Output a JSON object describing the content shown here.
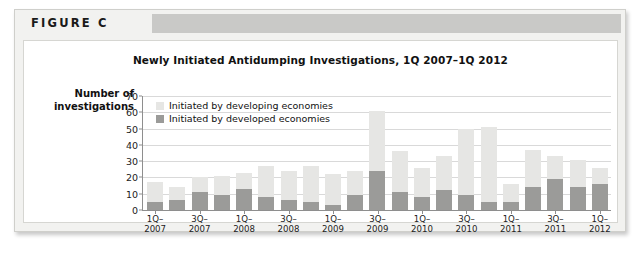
{
  "figure": {
    "label": "FIGURE C"
  },
  "chart_data": {
    "type": "bar",
    "subtype": "stacked-vertical",
    "title": "Newly Initiated Antidumping Investigations, 1Q 2007–1Q 2012",
    "xlabel": "",
    "ylabel": "Number of investigations",
    "ylabel_line1": "Number of",
    "ylabel_line2": "investigations",
    "ylim": [
      0,
      70
    ],
    "ytick_step": 10,
    "yticks": [
      0,
      10,
      20,
      30,
      40,
      50,
      60,
      70
    ],
    "grid": true,
    "grid_axis": "y",
    "legend_position": "top-left-inside",
    "categories": [
      "1Q-2007",
      "2Q-2007",
      "3Q-2007",
      "4Q-2007",
      "1Q-2008",
      "2Q-2008",
      "3Q-2008",
      "4Q-2008",
      "1Q-2009",
      "2Q-2009",
      "3Q-2009",
      "4Q-2009",
      "1Q-2010",
      "2Q-2010",
      "3Q-2010",
      "4Q-2010",
      "1Q-2011",
      "2Q-2011",
      "3Q-2011",
      "4Q-2011",
      "1Q-2012"
    ],
    "xtick_labels": [
      {
        "index": 0,
        "line1": "1Q–",
        "line2": "2007"
      },
      {
        "index": 2,
        "line1": "3Q–",
        "line2": "2007"
      },
      {
        "index": 4,
        "line1": "1Q–",
        "line2": "2008"
      },
      {
        "index": 6,
        "line1": "3Q–",
        "line2": "2008"
      },
      {
        "index": 8,
        "line1": "1Q–",
        "line2": "2009"
      },
      {
        "index": 10,
        "line1": "3Q–",
        "line2": "2009"
      },
      {
        "index": 12,
        "line1": "1Q–",
        "line2": "2010"
      },
      {
        "index": 14,
        "line1": "3Q–",
        "line2": "2010"
      },
      {
        "index": 16,
        "line1": "1Q–",
        "line2": "2011"
      },
      {
        "index": 18,
        "line1": "3Q–",
        "line2": "2011"
      },
      {
        "index": 20,
        "line1": "1Q–",
        "line2": "2012"
      }
    ],
    "series": [
      {
        "name": "Initiated by developed economies",
        "color": "#9b9b99",
        "values": [
          5,
          6,
          11,
          9,
          13,
          8,
          6,
          5,
          3,
          9,
          24,
          11,
          8,
          12,
          9,
          5,
          5,
          14,
          19,
          14,
          16
        ]
      },
      {
        "name": "Initiated by developing economies",
        "color": "#e6e6e4",
        "values": [
          12,
          8,
          9,
          12,
          10,
          19,
          18,
          22,
          19,
          15,
          37,
          25,
          18,
          21,
          41,
          46,
          11,
          23,
          14,
          17,
          10
        ]
      }
    ],
    "totals": [
      17,
      14,
      20,
      21,
      23,
      27,
      24,
      27,
      22,
      24,
      61,
      36,
      26,
      33,
      50,
      51,
      16,
      37,
      33,
      31,
      26
    ]
  }
}
